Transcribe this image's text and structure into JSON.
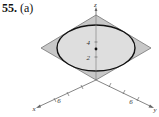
{
  "problem": {
    "number": "55.",
    "part": "(a)"
  },
  "figure": {
    "axes": {
      "z_label": "z",
      "x_label": "x",
      "y_label": "y"
    },
    "z_ticks": [
      "4",
      "2"
    ],
    "x_tick": "6",
    "y_tick": "6",
    "colors": {
      "plane_fill": "#c8c8c8",
      "plane_stroke": "#555555",
      "ellipse_fill": "#dcdcdc",
      "ellipse_stroke": "#111111",
      "axis": "#555555"
    }
  }
}
